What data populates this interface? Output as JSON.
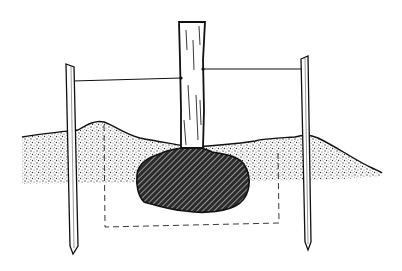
{
  "illustration": {
    "subject": "tree staking diagram",
    "elements": [
      "tree-trunk",
      "left-stake",
      "right-stake",
      "left-guy-wire",
      "right-guy-wire",
      "soil-mound",
      "root-ball",
      "planting-hole-outline"
    ],
    "colors": {
      "background": "#ffffff",
      "ink": "#111111",
      "soil": "#bdbdbd",
      "root_ball": "#3a3a3a"
    }
  }
}
